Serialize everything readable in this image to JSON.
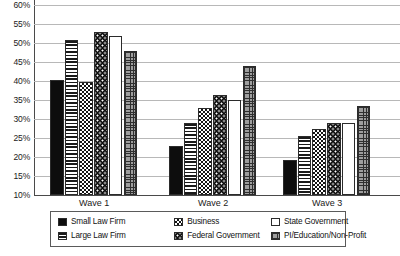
{
  "chart_data": {
    "type": "bar",
    "title": "",
    "subtitle": "",
    "xlabel": "",
    "ylabel": "",
    "categories": [
      "Wave 1",
      "Wave 2",
      "Wave 3"
    ],
    "ylim": [
      10,
      60
    ],
    "ytick_step": 5,
    "ytick_labels": [
      "60%",
      "55%",
      "50%",
      "45%",
      "40%",
      "35%",
      "30%",
      "25%",
      "20%",
      "15%",
      "10%"
    ],
    "ytick_values": [
      60,
      55,
      50,
      45,
      40,
      35,
      30,
      25,
      20,
      15,
      10
    ],
    "grid": true,
    "grid_axis": "y",
    "legend_position": "bottom",
    "value_format": "percent",
    "series": [
      {
        "name": "Small Law Firm",
        "pattern": "solid-black",
        "values": [
          40.2,
          23.0,
          19.2
        ]
      },
      {
        "name": "Large Law Firm",
        "pattern": "horizontal-lines",
        "values": [
          50.8,
          29.0,
          25.5
        ]
      },
      {
        "name": "Business",
        "pattern": "checkerboard",
        "values": [
          39.8,
          33.0,
          27.5
        ]
      },
      {
        "name": "Federal Government",
        "pattern": "dark-dotted",
        "values": [
          52.8,
          36.2,
          29.0
        ]
      },
      {
        "name": "State Government",
        "pattern": "white",
        "values": [
          51.8,
          35.0,
          29.0
        ]
      },
      {
        "name": "PI/Education/Non-Profit",
        "pattern": "grid-hatch",
        "values": [
          48.0,
          44.0,
          33.5
        ]
      }
    ]
  },
  "legend": {
    "items": [
      {
        "label": "Small Law Firm",
        "pattern": "solid-black"
      },
      {
        "label": "Large Law Firm",
        "pattern": "horizontal-lines"
      },
      {
        "label": "Business",
        "pattern": "checkerboard"
      },
      {
        "label": "Federal Government",
        "pattern": "dark-dotted"
      },
      {
        "label": "State Government",
        "pattern": "white"
      },
      {
        "label": "PI/Education/Non-Profit",
        "pattern": "grid-hatch"
      }
    ]
  },
  "colors": {
    "gridline": "#b8b8b8",
    "axis": "#4a4a4a",
    "text": "#1a1a1a",
    "bar_outline": "#2b2b2b",
    "background": "#ffffff"
  }
}
